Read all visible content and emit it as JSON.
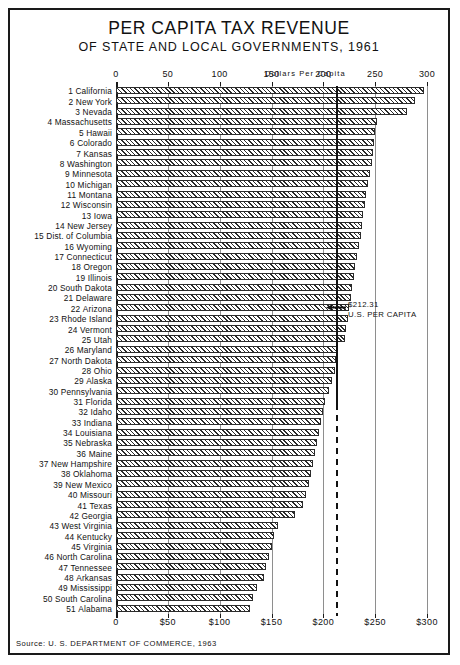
{
  "header": {
    "title": "PER CAPITA TAX REVENUE",
    "subtitle": "OF STATE AND LOCAL GOVERNMENTS, 1961"
  },
  "footer": {
    "source": "Source: U. S. DEPARTMENT OF COMMERCE, 1963"
  },
  "annotation": {
    "value_label": "$212.31",
    "caption": "U.S. PER CAPITA",
    "arrow_icon": "left-arrow-icon"
  },
  "chart_data": {
    "type": "bar",
    "orientation": "horizontal",
    "title": "PER CAPITA TAX REVENUE",
    "subtitle": "OF STATE AND LOCAL GOVERNMENTS, 1961",
    "xlabel": "Dollars  Per  Capita",
    "ylabel": "",
    "xlim": [
      0,
      300
    ],
    "grid": true,
    "legend": null,
    "axis_caption": "Dollars  Per  Capita",
    "ticks_top": [
      "0",
      "50",
      "100",
      "150",
      "200",
      "250",
      "300"
    ],
    "ticks_bottom": [
      "0",
      "$50",
      "$100",
      "$150",
      "$200",
      "$250",
      "$300"
    ],
    "tick_values": [
      0,
      50,
      100,
      150,
      200,
      250,
      300
    ],
    "reference_line": {
      "label": "$212.31",
      "sublabel": "U.S. PER CAPITA",
      "value": 212.31
    },
    "categories": [
      "California",
      "New York",
      "Nevada",
      "Massachusetts",
      "Hawaii",
      "Colorado",
      "Kansas",
      "Washington",
      "Minnesota",
      "Michigan",
      "Montana",
      "Wisconsin",
      "Iowa",
      "New Jersey",
      "Dist. of Columbia",
      "Wyoming",
      "Connecticut",
      "Oregon",
      "Illinois",
      "South Dakota",
      "Delaware",
      "Arizona",
      "Rhode Island",
      "Vermont",
      "Utah",
      "Maryland",
      "North Dakota",
      "Ohio",
      "Alaska",
      "Pennsylvania",
      "Florida",
      "Idaho",
      "Indiana",
      "Louisiana",
      "Nebraska",
      "Maine",
      "New Hampshire",
      "Oklahoma",
      "New Mexico",
      "Missouri",
      "Texas",
      "Georgia",
      "West Virginia",
      "Kentucky",
      "Virginia",
      "North Carolina",
      "Tennessee",
      "Arkansas",
      "Mississippi",
      "South Carolina",
      "Alabama"
    ],
    "ranks": [
      "1",
      "2",
      "3",
      "4",
      "5",
      "6",
      "7",
      "8",
      "9",
      "10",
      "11",
      "12",
      "13",
      "14",
      "15",
      "16",
      "17",
      "18",
      "19",
      "20",
      "21",
      "22",
      "23",
      "24",
      "25",
      "26",
      "27",
      "28",
      "29",
      "30",
      "31",
      "32",
      "33",
      "34",
      "35",
      "36",
      "37",
      "38",
      "39",
      "40",
      "41",
      "42",
      "43",
      "44",
      "45",
      "46",
      "47",
      "48",
      "49",
      "50",
      "51"
    ],
    "values": [
      297,
      288,
      281,
      252,
      250,
      249,
      248,
      247,
      245,
      243,
      241,
      240,
      238,
      237,
      236,
      234,
      232,
      231,
      230,
      228,
      227,
      225,
      224,
      222,
      221,
      213,
      212,
      211,
      208,
      205,
      202,
      200,
      198,
      196,
      194,
      192,
      190,
      188,
      186,
      183,
      180,
      173,
      156,
      152,
      150,
      148,
      145,
      143,
      136,
      132,
      129
    ]
  }
}
